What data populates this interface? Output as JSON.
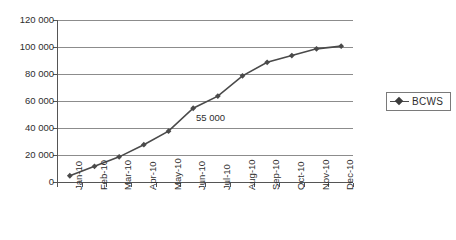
{
  "chart_data": {
    "type": "line",
    "title": "",
    "xlabel": "",
    "ylabel": "",
    "categories": [
      "Jan-10",
      "Feb-10",
      "Mar-10",
      "Apr-10",
      "May-10",
      "Jun-10",
      "Jul-10",
      "Aug-10",
      "Sep-10",
      "Oct-10",
      "Nov-10",
      "Dec-10"
    ],
    "series": [
      {
        "name": "BCWS",
        "values": [
          5000,
          12000,
          19000,
          28000,
          38000,
          55000,
          64000,
          79000,
          89000,
          94000,
          99000,
          101000
        ]
      }
    ],
    "ytick_labels": [
      "120 000",
      "100 000",
      "80 000",
      "60 000",
      "40 000",
      "20 000",
      "0"
    ],
    "ytick_values": [
      120000,
      100000,
      80000,
      60000,
      40000,
      20000,
      0
    ],
    "ylim": [
      0,
      120000
    ],
    "grid": "horizontal",
    "legend_position": "right",
    "annotations": [
      {
        "text": "55 000",
        "x_category": "Jun-10",
        "value": 55000
      }
    ],
    "marker": "diamond",
    "series_color": "#4a4a4a",
    "gridline_color": "#8c8c8c",
    "axis_color": "#555555",
    "background_color": "#ffffff"
  },
  "legend": {
    "entries": [
      {
        "label": "BCWS",
        "marker": "diamond-marker-icon"
      }
    ]
  }
}
